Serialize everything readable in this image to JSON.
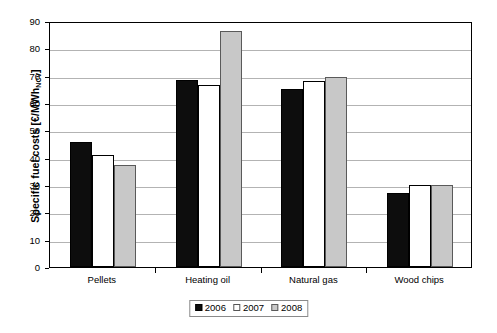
{
  "chart_data": {
    "type": "bar",
    "title": "",
    "subtitle": "",
    "xlabel": "",
    "ylabel": "Specific fuel costs [€/MWh NCV]",
    "ylabel_main": "Specific fuel costs [€/MWh",
    "ylabel_sub": "NCV",
    "ylabel_end": "]",
    "categories": [
      "Pellets",
      "Heating oil",
      "Natural gas",
      "Wood chips"
    ],
    "series": [
      {
        "name": "2006",
        "color": "#0d0d0d",
        "values": [
          45.8,
          68.5,
          65.0,
          27.2
        ]
      },
      {
        "name": "2007",
        "color": "#ffffff",
        "values": [
          41.0,
          66.5,
          68.0,
          30.0
        ]
      },
      {
        "name": "2008",
        "color": "#c8c8c8",
        "values": [
          37.5,
          86.5,
          69.5,
          30.0
        ]
      }
    ],
    "ylim": [
      0,
      90
    ],
    "yticks": [
      0,
      10,
      20,
      30,
      40,
      50,
      60,
      70,
      80,
      90
    ],
    "ytick_labels": [
      "0",
      "10",
      "20",
      "30",
      "40",
      "50",
      "60",
      "70",
      "80",
      "90"
    ],
    "grid": true,
    "grid_axis": "y",
    "legend": [
      "2006",
      "2007",
      "2008"
    ],
    "legend_position": "bottom-center"
  }
}
